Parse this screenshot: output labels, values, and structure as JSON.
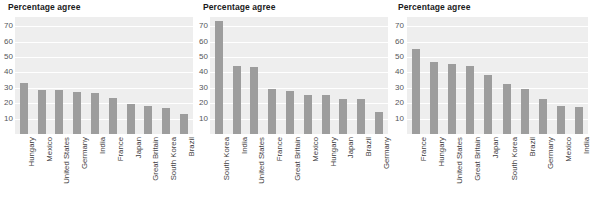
{
  "charts": [
    {
      "title": "Percentage agree",
      "yticks": [
        70,
        60,
        50,
        40,
        30,
        20,
        10
      ],
      "categories": [
        "Hungary",
        "Mexico",
        "United States",
        "Germany",
        "India",
        "France",
        "Japan",
        "Great Britain",
        "South Korea",
        "Brazil"
      ],
      "values": [
        33,
        28.5,
        28.5,
        27,
        26.5,
        23.5,
        19.5,
        18.5,
        17,
        13
      ]
    },
    {
      "title": "Percentage agree",
      "yticks": [
        70,
        60,
        50,
        40,
        30,
        20,
        10
      ],
      "categories": [
        "South Korea",
        "India",
        "United States",
        "France",
        "Great Britain",
        "Mexico",
        "Hungary",
        "Japan",
        "Brazil",
        "Germany"
      ],
      "values": [
        73.5,
        44,
        43.5,
        29,
        28,
        25.5,
        25.5,
        23,
        22.5,
        14.5
      ]
    },
    {
      "title": "Percentage agree",
      "yticks": [
        70,
        60,
        50,
        40,
        30,
        20,
        10
      ],
      "categories": [
        "France",
        "Hungary",
        "United States",
        "Great Britain",
        "Japan",
        "South Korea",
        "Brazil",
        "Germany",
        "Mexico",
        "India"
      ],
      "values": [
        55.5,
        46.5,
        45.5,
        44,
        38.5,
        32.5,
        29,
        22.5,
        18.5,
        17.5
      ]
    }
  ],
  "chart_data": [
    {
      "type": "bar",
      "title": "Percentage agree",
      "xlabel": "",
      "ylabel": "Percentage agree",
      "ylim": [
        0,
        76
      ],
      "ytick_labels": [
        "10",
        "20",
        "30",
        "40",
        "50",
        "60",
        "70"
      ],
      "grid": true,
      "legend": "none",
      "bar_color": "#9d9d9d",
      "plot_background": "#eeeeee",
      "categories": [
        "Hungary",
        "Mexico",
        "United States",
        "Germany",
        "India",
        "France",
        "Japan",
        "Great Britain",
        "South Korea",
        "Brazil"
      ],
      "values": [
        33,
        28.5,
        28.5,
        27,
        26.5,
        23.5,
        19.5,
        18.5,
        17,
        13
      ]
    },
    {
      "type": "bar",
      "title": "Percentage agree",
      "xlabel": "",
      "ylabel": "Percentage agree",
      "ylim": [
        0,
        76
      ],
      "ytick_labels": [
        "10",
        "20",
        "30",
        "40",
        "50",
        "60",
        "70"
      ],
      "grid": true,
      "legend": "none",
      "bar_color": "#9d9d9d",
      "plot_background": "#eeeeee",
      "categories": [
        "South Korea",
        "India",
        "United States",
        "France",
        "Great Britain",
        "Mexico",
        "Hungary",
        "Japan",
        "Brazil",
        "Germany"
      ],
      "values": [
        73.5,
        44,
        43.5,
        29,
        28,
        25.5,
        25.5,
        23,
        22.5,
        14.5
      ]
    },
    {
      "type": "bar",
      "title": "Percentage agree",
      "xlabel": "",
      "ylabel": "Percentage agree",
      "ylim": [
        0,
        76
      ],
      "ytick_labels": [
        "10",
        "20",
        "30",
        "40",
        "50",
        "60",
        "70"
      ],
      "grid": true,
      "legend": "none",
      "bar_color": "#9d9d9d",
      "plot_background": "#eeeeee",
      "categories": [
        "France",
        "Hungary",
        "United States",
        "Great Britain",
        "Japan",
        "South Korea",
        "Brazil",
        "Germany",
        "Mexico",
        "India"
      ],
      "values": [
        55.5,
        46.5,
        45.5,
        44,
        38.5,
        32.5,
        29,
        22.5,
        18.5,
        17.5
      ]
    }
  ]
}
